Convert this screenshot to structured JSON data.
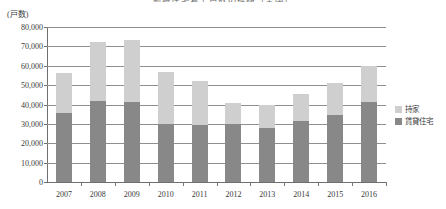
{
  "chart_data": {
    "type": "bar",
    "title": "新設住宅着工戸数の推移（全国）",
    "subtitle": "",
    "unit_label": "(戸数)",
    "xlabel": "",
    "ylabel": "",
    "stacked": true,
    "grid": true,
    "legend_position": "right",
    "ylim": [
      0,
      80000
    ],
    "yticks": [
      0,
      10000,
      20000,
      30000,
      40000,
      50000,
      60000,
      70000,
      80000
    ],
    "ytick_labels": [
      "0",
      "10,000",
      "20,000",
      "30,000",
      "40,000",
      "50,000",
      "60,000",
      "70,000",
      "80,000"
    ],
    "categories": [
      "2007",
      "2008",
      "2009",
      "2010",
      "2011",
      "2012",
      "2013",
      "2014",
      "2015",
      "2016"
    ],
    "series": [
      {
        "name": "賃貸住宅",
        "color": "#888888",
        "values": [
          35500,
          42000,
          41500,
          30000,
          29500,
          30000,
          28000,
          31500,
          34500,
          41500
        ]
      },
      {
        "name": "持家",
        "color": "#cfcfcf",
        "values": [
          21000,
          30500,
          32000,
          27000,
          22500,
          11000,
          12000,
          14000,
          16500,
          18500
        ]
      }
    ],
    "totals": [
      56500,
      72500,
      73500,
      57000,
      52000,
      41000,
      40000,
      45500,
      51000,
      60000
    ]
  },
  "legend": {
    "items": [
      {
        "label": "持家",
        "color": "#cfcfcf"
      },
      {
        "label": "賃貸住宅",
        "color": "#888888"
      }
    ]
  },
  "colors": {
    "owned": "#cfcfcf",
    "rental": "#888888",
    "grid": "#8f8f8f",
    "axis": "#6f6f6f",
    "text": "#3a3a3a"
  }
}
